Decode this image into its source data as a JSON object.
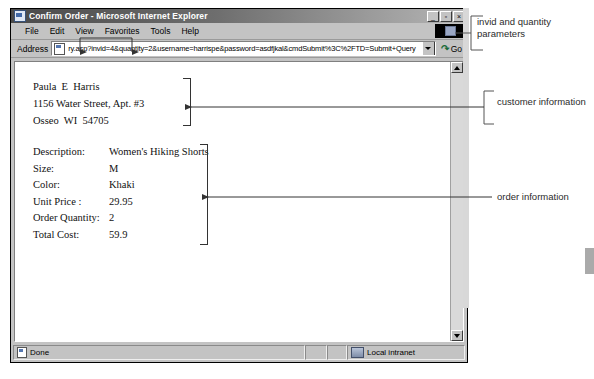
{
  "window": {
    "title": "Confirm Order - Microsoft Internet Explorer",
    "icon": "ie-document-icon",
    "minimize_label": "_",
    "restore_label": "▫",
    "close_label": "×"
  },
  "menu": {
    "items": [
      {
        "label": "File",
        "accel": "F"
      },
      {
        "label": "Edit",
        "accel": "E"
      },
      {
        "label": "View",
        "accel": "V"
      },
      {
        "label": "Favorites",
        "accel": "a"
      },
      {
        "label": "Tools",
        "accel": "T"
      },
      {
        "label": "Help",
        "accel": "H"
      }
    ]
  },
  "address": {
    "label": "Address",
    "url": "ry.asp?invid=4&quantity=2&username=harrispe&password=asdfjkal&cmdSubmit%3C%2FTD=Submit+Query",
    "go_label": "Go",
    "go_icon": "go-arrow-icon",
    "page_icon": "page-icon",
    "dropdown_icon": "chevron-down-icon"
  },
  "page": {
    "customer": {
      "name": "Paula  E  Harris",
      "street": "1156 Water Street, Apt. #3",
      "citystate": "Osseo  WI  54705"
    },
    "order": {
      "rows": [
        {
          "label": "Description:",
          "value": "Women's Hiking Shorts"
        },
        {
          "label": "Size:",
          "value": "M"
        },
        {
          "label": "Color:",
          "value": "Khaki"
        },
        {
          "label": "Unit Price :",
          "value": "29.95"
        },
        {
          "label": "Order Quantity:",
          "value": "2"
        },
        {
          "label": "Total Cost:",
          "value": "59.9"
        }
      ]
    }
  },
  "status_bar": {
    "status": "Done",
    "zone": "Local intranet",
    "status_icon": "page-icon",
    "zone_icon": "local-intranet-icon"
  },
  "annotations": {
    "invid": "invid and quantity parameters",
    "customer": "customer information",
    "order": "order information"
  },
  "colors": {
    "titlebar_dark": "#4a4a4a",
    "chrome": "#c3c3c3",
    "page": "#ffffff",
    "annotation_text": "#2b2b2b",
    "go_green": "#1b6b3a"
  }
}
